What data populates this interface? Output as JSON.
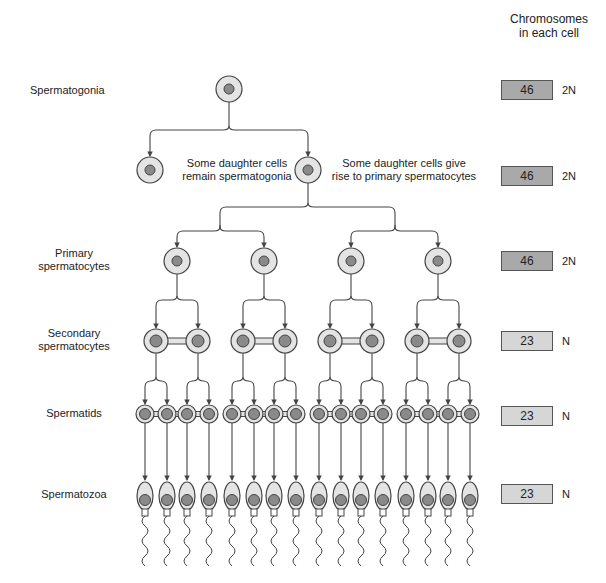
{
  "header": {
    "line1": "Chromosomes",
    "line2": "in each cell"
  },
  "stages": [
    {
      "id": "spermatogonia",
      "label_lines": [
        "Spermatogonia"
      ],
      "chromosomes": "46",
      "ploidy": "2N",
      "box_color": "#a9a9a9"
    },
    {
      "id": "daughter",
      "label_lines": [],
      "chromosomes": "46",
      "ploidy": "2N",
      "box_color": "#a9a9a9"
    },
    {
      "id": "primary",
      "label_lines": [
        "Primary",
        "spermatocytes"
      ],
      "chromosomes": "46",
      "ploidy": "2N",
      "box_color": "#a9a9a9"
    },
    {
      "id": "secondary",
      "label_lines": [
        "Secondary",
        "spermatocytes"
      ],
      "chromosomes": "23",
      "ploidy": "N",
      "box_color": "#d6d6d6"
    },
    {
      "id": "spermatids",
      "label_lines": [
        "Spermatids"
      ],
      "chromosomes": "23",
      "ploidy": "N",
      "box_color": "#d6d6d6"
    },
    {
      "id": "spermatozoa",
      "label_lines": [
        "Spermatozoa"
      ],
      "chromosomes": "23",
      "ploidy": "N",
      "box_color": "#d6d6d6"
    }
  ],
  "notes": {
    "remain": [
      "Some daughter cells",
      "remain spermatogonia"
    ],
    "give_rise": [
      "Some daughter cells give",
      "rise to primary spermatocytes"
    ]
  },
  "counts": {
    "spermatogonia": 1,
    "daughter_cells": 2,
    "primary_spermatocytes": 4,
    "secondary_spermatocytes": 8,
    "spermatids": 16,
    "spermatozoa": 16
  },
  "colors": {
    "cell_fill": "#e4e4e4",
    "nucleus_fill": "#8a8a8a",
    "outline": "#444444",
    "line": "#444444"
  }
}
